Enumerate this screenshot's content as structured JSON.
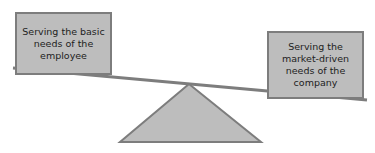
{
  "diagram": {
    "type": "balance-scale",
    "left_pan": {
      "label": "Serving the basic needs of the employee"
    },
    "right_pan": {
      "label": "Serving the market-driven needs of the company"
    },
    "tilt": "left side higher, right side lower",
    "colors": {
      "fill": "#bdbdbd",
      "stroke": "#7d7d7d",
      "text": "#222222"
    }
  }
}
